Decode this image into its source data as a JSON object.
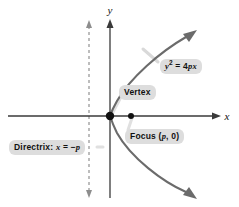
{
  "figure": {
    "background": "#ffffff",
    "axes": {
      "x_label": "x",
      "y_label": "y",
      "origin": {
        "x": 110,
        "y": 116
      },
      "x_axis": {
        "from_x": 8,
        "to_x": 222,
        "y": 116
      },
      "y_axis": {
        "x": 110,
        "from_y": 198,
        "to_y": 18
      },
      "axis_color": "#3a3a3a"
    },
    "curve": {
      "equation_text": "y² = 4px",
      "color": "#6b6b6b",
      "opens": "right",
      "vertex": {
        "x": 0,
        "y": 0
      },
      "focus": {
        "x": "p",
        "y": 0
      },
      "directrix_equation": "x = -p"
    },
    "points": [
      {
        "name": "vertex",
        "label": "Vertex",
        "cx": 110,
        "cy": 116,
        "color": "#111111"
      },
      {
        "name": "focus",
        "label": "Focus (p, 0)",
        "cx": 131,
        "cy": 116,
        "color": "#111111"
      }
    ],
    "directrix": {
      "label": "Directrix: x = -p",
      "x": 89,
      "style": "dashed",
      "color": "#9a9a9a",
      "arrow_top_y": 22,
      "arrow_bottom_y": 196
    },
    "callouts": {
      "equation": {
        "prefix": "y",
        "superscript": "2",
        "equals": " = 4",
        "variables": "px",
        "full_text": "y2 = 4px"
      },
      "vertex": {
        "text": "Vertex"
      },
      "focus": {
        "prefix": "Focus (",
        "variable": "p",
        "suffix": ", 0)",
        "full_text": "Focus (p, 0)"
      },
      "directrix": {
        "prefix": "Directrix: ",
        "variable": "x",
        "equals": " = −",
        "variable2": "p",
        "full_text": "Directrix: x = −p"
      }
    },
    "colors": {
      "label_background": "#dddddd",
      "label_text": "#111111",
      "curve": "#6b6b6b",
      "axis": "#3a3a3a",
      "directrix": "#9a9a9a",
      "leader_line": "#d6d6d6"
    }
  }
}
